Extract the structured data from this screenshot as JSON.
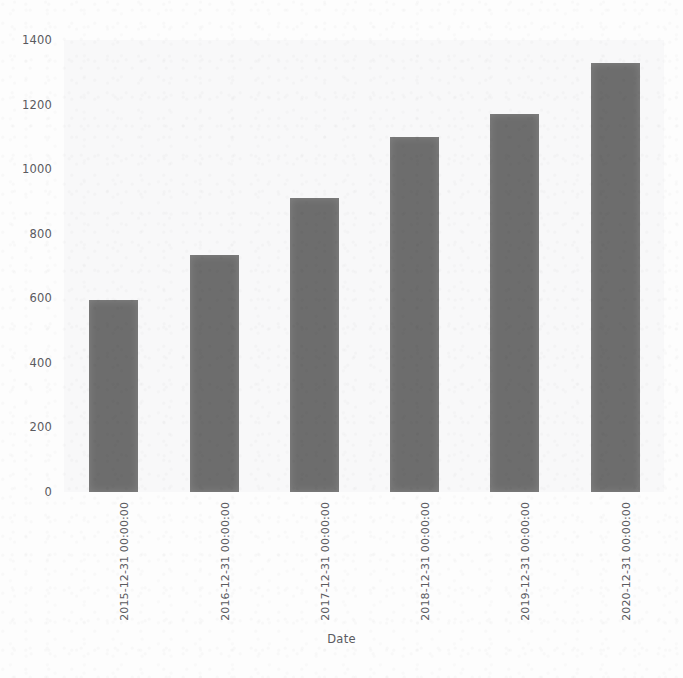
{
  "chart_data": {
    "type": "bar",
    "title": "",
    "subtitle": "",
    "xlabel": "Date",
    "ylabel": "",
    "categories": [
      "2015-12-31 00:00:00",
      "2016-12-31 00:00:00",
      "2017-12-31 00:00:00",
      "2018-12-31 00:00:00",
      "2019-12-31 00:00:00",
      "2020-12-31 00:00:00"
    ],
    "values": [
      595,
      735,
      910,
      1100,
      1170,
      1330
    ],
    "ylim": [
      0,
      1400
    ],
    "yticks": [
      0,
      200,
      400,
      600,
      800,
      1000,
      1200,
      1400
    ],
    "ytick_labels": [
      "0",
      "200",
      "400",
      "600",
      "800",
      "1000",
      "1200",
      "1400"
    ],
    "grid": false,
    "legend": null,
    "bar_color": "#6d6d6d",
    "background_color": "#f8f8f9",
    "figure_background": "#fdfdfd",
    "tick_label_color": "#5a5a5f",
    "xtick_rotation": 90,
    "annotations": []
  }
}
